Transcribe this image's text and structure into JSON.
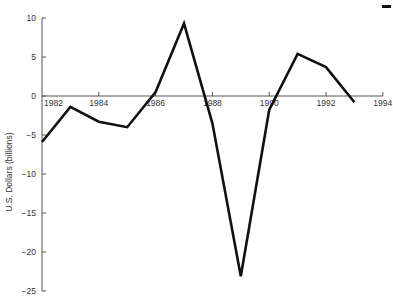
{
  "chart_data": {
    "type": "line",
    "title": "",
    "xlabel": "",
    "ylabel": "U.S. Dollars (billions)",
    "xlim": [
      1982,
      1994
    ],
    "ylim": [
      -25,
      10
    ],
    "x_ticks": [
      1982,
      1984,
      1986,
      1988,
      1990,
      1992,
      1994
    ],
    "x_tick_labels": [
      "1982",
      "1984",
      "1986",
      "1988",
      "1990",
      "1992",
      "1994"
    ],
    "y_ticks": [
      10,
      5,
      0,
      -5,
      -10,
      -15,
      -20,
      -25
    ],
    "y_tick_labels": [
      "10",
      "5",
      "0",
      "−5",
      "−10",
      "−15",
      "−20",
      "−25"
    ],
    "grid": false,
    "legend": null,
    "x": [
      1982,
      1983,
      1984,
      1985,
      1986,
      1987,
      1988,
      1989,
      1990,
      1991,
      1992,
      1993
    ],
    "series": [
      {
        "name": "U.S. Dollars (billions)",
        "values": [
          -5.9,
          -1.4,
          -3.3,
          -4.0,
          0.5,
          9.3,
          -3.5,
          -23.1,
          -1.8,
          5.4,
          3.7,
          -0.8
        ]
      }
    ]
  }
}
